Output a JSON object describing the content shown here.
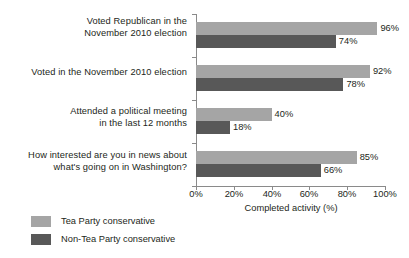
{
  "chart_data": {
    "type": "bar",
    "orientation": "horizontal",
    "title": "",
    "xlabel": "Completed activity (%)",
    "ylabel": "",
    "xlim": [
      0,
      100
    ],
    "xticks": [
      "0%",
      "20%",
      "40%",
      "60%",
      "80%",
      "100%"
    ],
    "grid": false,
    "legend_position": "bottom-left",
    "categories": [
      "Voted Republican in the November 2010 election",
      "Voted in the November 2010 election",
      "Attended a political meeting in the last 12 months",
      "How interested are you in news about what's going on in Washington?"
    ],
    "category_lines": [
      [
        "Voted Republican in the",
        "November 2010 election"
      ],
      [
        "Voted in the November 2010 election"
      ],
      [
        "Attended a political meeting",
        "in the last 12 months"
      ],
      [
        "How interested are you in news about",
        "what's going on in Washington?"
      ]
    ],
    "series": [
      {
        "name": "Tea Party conservative",
        "color": "#a5a5a5",
        "values": [
          96,
          92,
          40,
          85
        ],
        "labels": [
          "96%",
          "92%",
          "40%",
          "85%"
        ]
      },
      {
        "name": "Non-Tea Party conservative",
        "color": "#585858",
        "values": [
          74,
          78,
          18,
          66
        ],
        "labels": [
          "74%",
          "78%",
          "18%",
          "66%"
        ]
      }
    ]
  },
  "legend": {
    "items": [
      {
        "label": "Tea Party conservative",
        "color": "#a5a5a5"
      },
      {
        "label": "Non-Tea Party conservative",
        "color": "#585858"
      }
    ]
  }
}
